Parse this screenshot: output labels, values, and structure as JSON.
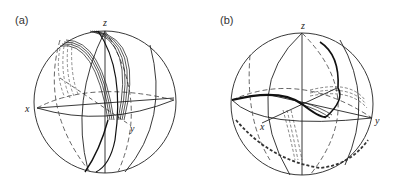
{
  "panels": [
    {
      "label": "(a)",
      "axes": {
        "x": "x",
        "y": "y",
        "z": "z"
      },
      "description": "Bloch sphere with bundle of trajectories sweeping from near north pole down toward y-axis region"
    },
    {
      "label": "(b)",
      "axes": {
        "x": "x",
        "y": "y",
        "z": "z"
      },
      "description": "Bloch sphere with trajectory curving from upper right across equator region to left edge, with dashed back-side traces"
    }
  ],
  "colors": {
    "line": "#222222",
    "dashed": "#555555",
    "background": "#ffffff"
  }
}
